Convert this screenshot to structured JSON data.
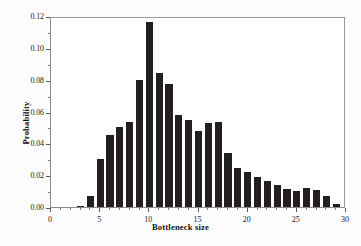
{
  "chart_data": {
    "type": "bar",
    "title": "",
    "xlabel": "Bottleneck size",
    "ylabel": "Probability",
    "xlim": [
      0,
      30
    ],
    "ylim": [
      0,
      0.12
    ],
    "grid": false,
    "legend": null,
    "x_ticks": [
      "0",
      "5",
      "10",
      "15",
      "20",
      "25",
      "30"
    ],
    "x_tick_values": [
      0,
      5,
      10,
      15,
      20,
      25,
      30
    ],
    "x_minor_tick_values": [
      1,
      2,
      3,
      4,
      6,
      7,
      8,
      9,
      11,
      12,
      13,
      14,
      16,
      17,
      18,
      19,
      21,
      22,
      23,
      24,
      26,
      27,
      28,
      29
    ],
    "y_ticks": [
      "0.00",
      "0.02",
      "0.04",
      "0.06",
      "0.08",
      "0.10",
      "0.12"
    ],
    "y_tick_values": [
      0.0,
      0.02,
      0.04,
      0.06,
      0.08,
      0.1,
      0.12
    ],
    "y_minor_tick_values": [
      0.01,
      0.03,
      0.05,
      0.07,
      0.09,
      0.11
    ],
    "bar_color": "#231f20",
    "axis_color": "#8b8b8b",
    "bar_width": 0.72,
    "categories": [
      3,
      4,
      5,
      6,
      7,
      8,
      9,
      10,
      11,
      12,
      13,
      14,
      15,
      16,
      17,
      18,
      19,
      20,
      21,
      22,
      23,
      24,
      25,
      26,
      27,
      28,
      29
    ],
    "values": [
      0.0008,
      0.007,
      0.03,
      0.045,
      0.0505,
      0.0535,
      0.0795,
      0.1163,
      0.0842,
      0.077,
      0.058,
      0.0548,
      0.0475,
      0.0527,
      0.0537,
      0.0342,
      0.0242,
      0.0217,
      0.019,
      0.0163,
      0.0139,
      0.0116,
      0.0098,
      0.0121,
      0.0106,
      0.007,
      0.0021
    ],
    "series": [
      {
        "name": "Probability",
        "values": [
          0.0008,
          0.007,
          0.03,
          0.045,
          0.0505,
          0.0535,
          0.0795,
          0.1163,
          0.0842,
          0.077,
          0.058,
          0.0548,
          0.0475,
          0.0527,
          0.0537,
          0.0342,
          0.0242,
          0.0217,
          0.019,
          0.0163,
          0.0139,
          0.0116,
          0.0098,
          0.0121,
          0.0106,
          0.007,
          0.0021
        ]
      }
    ]
  }
}
